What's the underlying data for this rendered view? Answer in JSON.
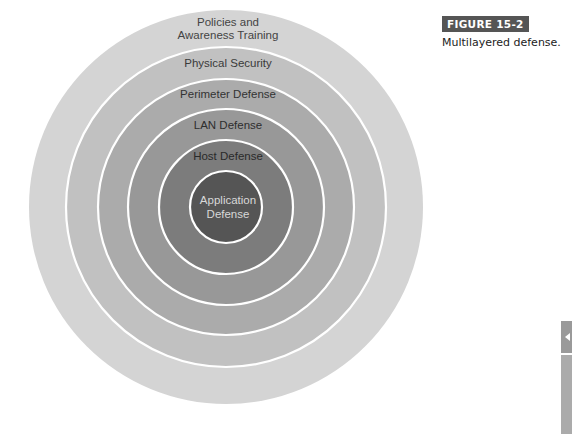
{
  "figure": {
    "badge": "FIGURE 15-2",
    "caption": "Multilayered defense."
  },
  "diagram": {
    "type": "concentric-circles",
    "center": [
      226,
      207
    ],
    "layers": [
      {
        "label_lines": [
          "Policies and",
          "Awareness Training"
        ],
        "radius": 197,
        "fill": "#d4d4d4",
        "text_color": "#444444"
      },
      {
        "label_lines": [
          "Physical Security"
        ],
        "radius": 160,
        "fill": "#c1c1c1",
        "text_color": "#3a3a3a"
      },
      {
        "label_lines": [
          "Perimeter Defense"
        ],
        "radius": 128,
        "fill": "#ababab",
        "text_color": "#333333"
      },
      {
        "label_lines": [
          "LAN Defense"
        ],
        "radius": 98,
        "fill": "#989898",
        "text_color": "#2e2e2e"
      },
      {
        "label_lines": [
          "Host Defense"
        ],
        "radius": 67,
        "fill": "#7c7c7c",
        "text_color": "#2a2a2a"
      },
      {
        "label_lines": [
          "Application",
          "Defense"
        ],
        "radius": 36,
        "fill": "#555555",
        "text_color": "#d8d8d8"
      }
    ],
    "divider_color": "#ffffff"
  },
  "side_tab": {
    "icon": "chevron-left-icon"
  }
}
